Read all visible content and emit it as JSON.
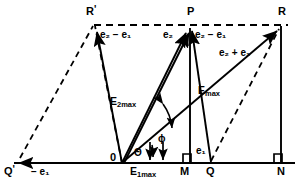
{
  "figure": {
    "colors": {
      "line": "#000000",
      "background": "#ffffff",
      "text": "#000000"
    },
    "points": [
      {
        "name": "R-prime",
        "label_main": "R",
        "label_prime": "'",
        "x": 90,
        "y": 12
      },
      {
        "name": "P",
        "label_main": "P",
        "label_prime": "",
        "x": 190,
        "y": 12
      },
      {
        "name": "R",
        "label_main": "R",
        "label_prime": "",
        "x": 281,
        "y": 12
      },
      {
        "name": "Q-prime",
        "label_main": "Q",
        "label_prime": "'",
        "x": 9,
        "y": 172
      },
      {
        "name": "origin",
        "label_main": "0",
        "label_prime": "",
        "x": 113,
        "y": 158
      },
      {
        "name": "M",
        "label_main": "M",
        "label_prime": "",
        "x": 183,
        "y": 172
      },
      {
        "name": "Q",
        "label_main": "Q",
        "label_prime": "",
        "x": 209,
        "y": 172
      },
      {
        "name": "N",
        "label_main": "N",
        "label_prime": "",
        "x": 281,
        "y": 172
      }
    ],
    "vector_labels": [
      {
        "name": "e2-minus-e1-left",
        "text": "e₂ − e₁",
        "x": 103,
        "y": 34
      },
      {
        "name": "e2-top",
        "text": "e₂",
        "x": 166,
        "y": 34
      },
      {
        "name": "e2-minus-e1-right",
        "text": "e₂ − e₁",
        "x": 198,
        "y": 34
      },
      {
        "name": "e2-plus-e1",
        "text": "e₂ + e₁",
        "x": 222,
        "y": 52
      },
      {
        "name": "E2max",
        "text": "E₂max",
        "x": 113,
        "y": 101
      },
      {
        "name": "Emax",
        "text": "Emax",
        "x": 200,
        "y": 91
      },
      {
        "name": "E1max",
        "text": "E₁max",
        "x": 133,
        "y": 170
      },
      {
        "name": "minus-e1",
        "text": "− e₁",
        "x": 35,
        "y": 172
      },
      {
        "name": "e1-at-Q",
        "text": "e₁",
        "x": 199,
        "y": 150
      }
    ],
    "angle_labels": [
      {
        "name": "theta",
        "text": "Θ",
        "x": 136,
        "y": 152
      },
      {
        "name": "phi",
        "text": "ϕ",
        "x": 160,
        "y": 139
      }
    ],
    "annotations": {
      "right_angle_M": "right-angle-marker",
      "right_angle_N": "right-angle-marker",
      "baseline": "horizontal-axis",
      "top_line": "dashed-horizontal-construction-line"
    }
  }
}
